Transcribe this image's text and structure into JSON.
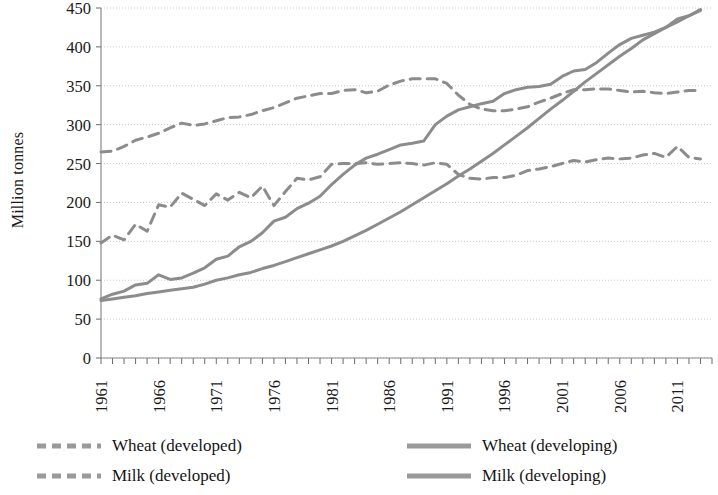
{
  "chart_data": {
    "type": "line",
    "title": "",
    "xlabel": "",
    "ylabel": "Million tonnes",
    "xlim": [
      1961,
      2014
    ],
    "ylim": [
      0,
      450
    ],
    "grid": true,
    "legend_position": "bottom",
    "y_ticks": [
      0,
      50,
      100,
      150,
      200,
      250,
      300,
      350,
      400,
      450
    ],
    "x_tick_labels": [
      "1961",
      "1966",
      "1971",
      "1976",
      "1981",
      "1986",
      "1991",
      "1996",
      "2001",
      "2006",
      "2011"
    ],
    "x_tick_values": [
      1961,
      1966,
      1971,
      1976,
      1981,
      1986,
      1991,
      1996,
      2001,
      2006,
      2011
    ],
    "x_minor_tick_step": 1,
    "line_color": "#8c8c8c",
    "x": [
      1961,
      1962,
      1963,
      1964,
      1965,
      1966,
      1967,
      1968,
      1969,
      1970,
      1971,
      1972,
      1973,
      1974,
      1975,
      1976,
      1977,
      1978,
      1979,
      1980,
      1981,
      1982,
      1983,
      1984,
      1985,
      1986,
      1987,
      1988,
      1989,
      1990,
      1991,
      1992,
      1993,
      1994,
      1995,
      1996,
      1997,
      1998,
      1999,
      2000,
      2001,
      2002,
      2003,
      2004,
      2005,
      2006,
      2007,
      2008,
      2009,
      2010,
      2011,
      2012,
      2013
    ],
    "series": [
      {
        "name": "Wheat (developed)",
        "style": "dashed",
        "color": "#8c8c8c",
        "values": [
          148,
          158,
          152,
          172,
          163,
          197,
          194,
          212,
          204,
          196,
          211,
          203,
          213,
          206,
          221,
          196,
          214,
          231,
          229,
          233,
          249,
          250,
          250,
          251,
          249,
          250,
          251,
          250,
          248,
          251,
          249,
          236,
          231,
          230,
          232,
          232,
          235,
          241,
          243,
          246,
          250,
          254,
          252,
          255,
          257,
          256,
          257,
          261,
          263,
          258,
          272,
          258,
          256
        ]
      },
      {
        "name": "Milk (developed)",
        "style": "dashed",
        "color": "#8c8c8c",
        "values": [
          265,
          266,
          272,
          280,
          284,
          289,
          296,
          302,
          299,
          301,
          305,
          309,
          310,
          313,
          318,
          322,
          328,
          334,
          337,
          340,
          340,
          344,
          345,
          341,
          343,
          351,
          356,
          359,
          359,
          359,
          353,
          338,
          326,
          320,
          318,
          318,
          320,
          323,
          329,
          334,
          340,
          345,
          345,
          346,
          346,
          344,
          342,
          343,
          341,
          340,
          342,
          344,
          344
        ]
      },
      {
        "name": "Wheat (developing)",
        "style": "solid",
        "color": "#8c8c8c",
        "values": [
          76,
          82,
          86,
          94,
          96,
          107,
          101,
          103,
          109,
          116,
          127,
          131,
          143,
          150,
          161,
          176,
          181,
          192,
          199,
          208,
          223,
          236,
          248,
          257,
          262,
          268,
          274,
          276,
          279,
          300,
          311,
          319,
          323,
          327,
          330,
          340,
          345,
          348,
          349,
          352,
          362,
          369,
          371,
          380,
          392,
          403,
          411,
          415,
          419,
          425,
          436,
          440,
          448
        ]
      },
      {
        "name": "Milk (developing)",
        "style": "solid",
        "color": "#8c8c8c",
        "values": [
          74,
          76,
          78,
          80,
          83,
          85,
          87,
          89,
          91,
          95,
          100,
          103,
          107,
          110,
          115,
          119,
          124,
          129,
          134,
          139,
          144,
          150,
          157,
          164,
          172,
          180,
          188,
          197,
          206,
          215,
          224,
          234,
          243,
          253,
          263,
          274,
          285,
          296,
          308,
          320,
          331,
          343,
          355,
          366,
          377,
          388,
          398,
          409,
          417,
          425,
          432,
          440,
          447
        ]
      }
    ]
  },
  "legend": {
    "items": [
      {
        "label": "Wheat (developed)",
        "style": "dashed",
        "color": "#8c8c8c"
      },
      {
        "label": "Milk (developed)",
        "style": "dashed",
        "color": "#8c8c8c"
      },
      {
        "label": "Wheat (developing)",
        "style": "solid",
        "color": "#8c8c8c"
      },
      {
        "label": "Milk (developing)",
        "style": "solid",
        "color": "#8c8c8c"
      }
    ]
  }
}
